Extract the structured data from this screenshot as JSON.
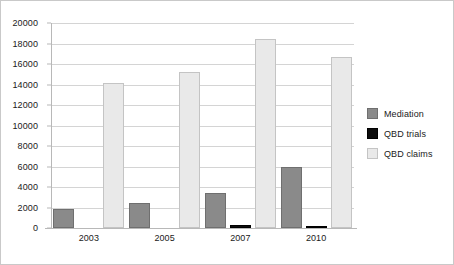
{
  "chart_data": {
    "type": "bar",
    "title": "",
    "subtitle": "",
    "xlabel": "",
    "ylabel": "",
    "categories": [
      "2003",
      "2005",
      "2007",
      "2010"
    ],
    "series": [
      {
        "name": "Mediation",
        "color": "#8a8a8a",
        "values": [
          1850,
          2450,
          3400,
          6000
        ]
      },
      {
        "name": "QBD trials",
        "color": "#0d0d0d",
        "values": [
          0,
          0,
          250,
          200
        ]
      },
      {
        "name": "QBD claims",
        "color": "#e9e9e9",
        "values": [
          14150,
          15250,
          18450,
          16650
        ]
      }
    ],
    "ylim": [
      0,
      20000
    ],
    "y_ticks": [
      0,
      2000,
      4000,
      6000,
      8000,
      10000,
      12000,
      14000,
      16000,
      18000,
      20000
    ],
    "y_tick_labels": [
      "0",
      "2000",
      "4000",
      "6000",
      "8000",
      "10000",
      "12000",
      "14000",
      "16000",
      "18000",
      "20000"
    ],
    "grid": true,
    "grid_axis": "y",
    "legend_position": "right",
    "legend_entries": [
      "Mediation",
      "QBD trials",
      "QBD claims"
    ],
    "annotations": []
  },
  "colors": {
    "background": "#ffffff",
    "frame": "#c9c9c9",
    "gridline": "#d4d4d4",
    "axis": "#b8b8b8",
    "text": "#1a1a1a"
  }
}
